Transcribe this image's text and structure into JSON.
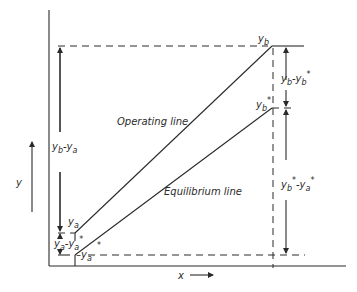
{
  "diagram": {
    "axes": {
      "x_label": "x",
      "y_label": "y"
    },
    "lines": {
      "operating_line_label": "Operating line",
      "equilibrium_line_label": "Equilibrium line"
    },
    "points": {
      "yb": "y",
      "yb_sub": "b",
      "yb_star": "y",
      "yb_star_sub": "b",
      "yb_star_sup": "*",
      "ya": "y",
      "ya_sub": "a",
      "ya_star": "y",
      "ya_star_sub": "a",
      "ya_star_sup": "*"
    },
    "dimensions": {
      "yb_minus_ya": {
        "a": "y",
        "a_sub": "b",
        "op": "-",
        "b": "y",
        "b_sub": "a"
      },
      "ya_minus_ya_star": {
        "a": "y",
        "a_sub": "a",
        "op": "-",
        "b": "y",
        "b_sub": "a",
        "b_sup": "*"
      },
      "yb_minus_yb_star": {
        "a": "y",
        "a_sub": "b",
        "op": "-",
        "b": "y",
        "b_sub": "b",
        "b_sup": "*"
      },
      "yb_star_minus_ya_star": {
        "a": "y",
        "a_sub": "b",
        "a_sup": "*",
        "op": "-",
        "b": "y",
        "b_sub": "a",
        "b_sup": "*"
      }
    }
  }
}
